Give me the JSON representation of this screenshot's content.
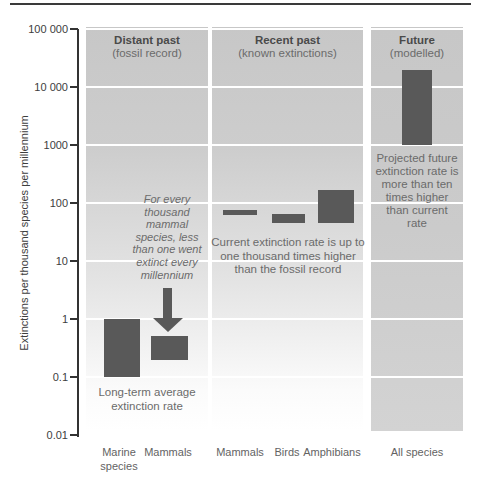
{
  "figure": {
    "y_axis_label": "Extinctions per thousand species per millennium"
  },
  "panels": [
    {
      "title": "Distant past",
      "subtitle": "(fossil record)"
    },
    {
      "title": "Recent past",
      "subtitle": "(known extinctions)"
    },
    {
      "title": "Future",
      "subtitle": "(modelled)"
    }
  ],
  "annotations": {
    "fossil_note": "For every\nthousand\nmammal\nspecies, less\nthan one went\nextinct every\nmillennium",
    "longterm_note": "Long-term average\nextinction rate",
    "current_note": "Current extinction rate is up to\none thousand times higher\nthan the fossil record",
    "future_note": "Projected future\nextinction rate is\nmore than ten\ntimes higher\nthan current\nrate"
  },
  "x_labels": [
    "Marine\nspecies",
    "Mammals",
    "Mammals",
    "Birds",
    "Amphibians",
    "All species"
  ],
  "colors": {
    "bar": "#595959",
    "panel_gray": "#c7c7c7",
    "gridline": "#ffffff",
    "axis": "#333333"
  },
  "chart_data": {
    "type": "bar",
    "ylabel": "Extinctions per thousand species per millennium",
    "yscale": "log",
    "ylim": [
      0.01,
      100000
    ],
    "grid": true,
    "legend": false,
    "yticks": [
      {
        "value": 100000,
        "label": "100 000"
      },
      {
        "value": 10000,
        "label": "10 000"
      },
      {
        "value": 1000,
        "label": "1000"
      },
      {
        "value": 100,
        "label": "100"
      },
      {
        "value": 10,
        "label": "10"
      },
      {
        "value": 1,
        "label": "1"
      },
      {
        "value": 0.1,
        "label": "0.1"
      },
      {
        "value": 0.01,
        "label": "0.01"
      }
    ],
    "bars": [
      {
        "id": "marine-species",
        "category": "Marine species",
        "panel": "Distant past (fossil record)",
        "range": [
          0.1,
          1
        ],
        "px": {
          "x": 104,
          "w": 36
        }
      },
      {
        "id": "mammals-fossil",
        "category": "Mammals",
        "panel": "Distant past (fossil record)",
        "range": [
          0.2,
          0.5
        ],
        "px": {
          "x": 151,
          "w": 37
        }
      },
      {
        "id": "mammals-recent",
        "category": "Mammals",
        "panel": "Recent past (known extinctions)",
        "range": [
          63,
          77
        ],
        "px": {
          "x": 223,
          "w": 34
        }
      },
      {
        "id": "birds-recent",
        "category": "Birds",
        "panel": "Recent past (known extinctions)",
        "range": [
          45,
          65
        ],
        "px": {
          "x": 272,
          "w": 33
        }
      },
      {
        "id": "amphibians-recent",
        "category": "Amphibians",
        "panel": "Recent past (known extinctions)",
        "range": [
          45,
          170
        ],
        "px": {
          "x": 318,
          "w": 36
        }
      },
      {
        "id": "all-species-future",
        "category": "All species",
        "panel": "Future (modelled)",
        "range": [
          1000,
          20000
        ],
        "px": {
          "x": 402,
          "w": 30
        }
      }
    ]
  }
}
